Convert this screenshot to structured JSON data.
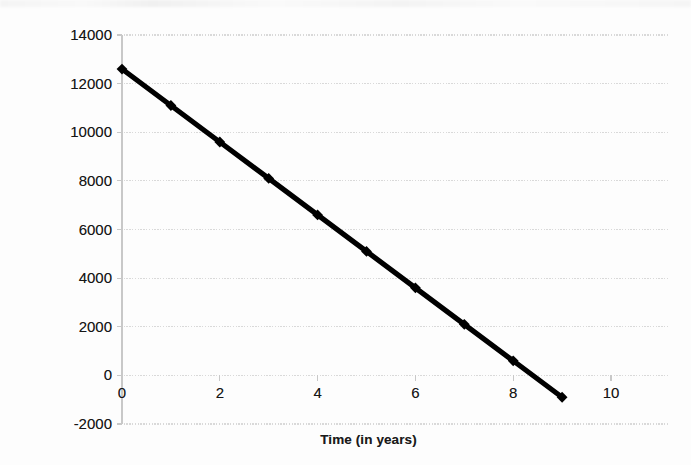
{
  "chart_data": {
    "type": "line",
    "title": "",
    "xlabel": "Time (in years)",
    "ylabel": "Value of Car",
    "x": [
      0,
      1,
      2,
      3,
      4,
      5,
      6,
      7,
      8,
      9
    ],
    "values": [
      12600,
      11100,
      9600,
      8100,
      6600,
      5100,
      3600,
      2100,
      600,
      -900
    ],
    "series": [
      {
        "name": "Value of Car",
        "values": [
          12600,
          11100,
          9600,
          8100,
          6600,
          5100,
          3600,
          2100,
          600,
          -900
        ]
      }
    ],
    "xlim": [
      0,
      10
    ],
    "ylim": [
      -2000,
      14000
    ],
    "x_ticks": [
      0,
      2,
      4,
      6,
      8,
      10
    ],
    "x_tick_labels": [
      "0",
      "2",
      "4",
      "6",
      "8",
      "10"
    ],
    "y_ticks": [
      -2000,
      0,
      2000,
      4000,
      6000,
      8000,
      10000,
      12000,
      14000
    ],
    "y_tick_labels": [
      "-2000",
      "0",
      "2000",
      "4000",
      "6000",
      "8000",
      "10000",
      "12000",
      "14000"
    ],
    "grid": true,
    "legend": false,
    "legend_position": "none",
    "marker": "diamond",
    "line_color": "#000000",
    "grid_color": "#d9d9d9",
    "axis_color": "#c8c8c8",
    "background_color": "#ffffff",
    "annotations": []
  }
}
